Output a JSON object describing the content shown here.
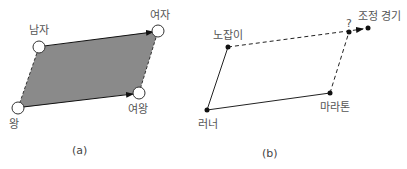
{
  "diagram_a": {
    "caption": "(a)",
    "nodes": {
      "man": "남자",
      "woman": "여자",
      "king": "왕",
      "queen": "여왕"
    },
    "fill_color": "#8a8a8a"
  },
  "diagram_b": {
    "caption": "(b)",
    "nodes": {
      "slacker": "노잡이",
      "rowing": "조정 경기",
      "runner": "러너",
      "marathon": "마라톤",
      "unknown": "?"
    }
  }
}
